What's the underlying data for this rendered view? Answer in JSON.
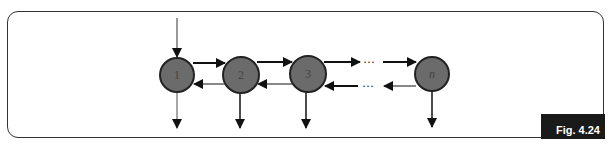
{
  "figure": {
    "label": "Fig. 4.24"
  },
  "nodes": [
    {
      "id": "1",
      "label": "1"
    },
    {
      "id": "2",
      "label": "2"
    },
    {
      "id": "3",
      "label": "3"
    },
    {
      "id": "n",
      "label": "n"
    }
  ],
  "ellipsis": "···",
  "colors": {
    "node_fill": "#6b6b6b",
    "node_stroke": "#222222",
    "arrow": "#111111",
    "back_arrow_line": "#888888",
    "label_bg": "#1a1a1a",
    "label_text": "#ffffff"
  }
}
